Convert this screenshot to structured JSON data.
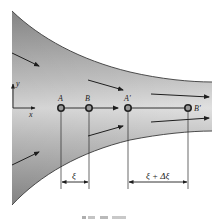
{
  "figure": {
    "colors": {
      "channel_dark": "#8a8a8a",
      "channel_light": "#e2e2e2",
      "boundary": "#3a3a3a",
      "arrow": "#1e1e1e",
      "point_fill": "#9a9a9a",
      "point_stroke": "#222222"
    },
    "axes": {
      "x_label": "x",
      "y_label": "y"
    },
    "points": [
      {
        "label": "A",
        "x": 61
      },
      {
        "label": "B",
        "x": 89
      },
      {
        "label": "A′",
        "x": 128
      },
      {
        "label": "B′",
        "x": 188
      }
    ],
    "dimensions": [
      {
        "label": "ξ",
        "from": "A",
        "to": "B"
      },
      {
        "label": "ξ + Δξ",
        "from": "A′",
        "to": "B′"
      }
    ],
    "caption": ""
  }
}
